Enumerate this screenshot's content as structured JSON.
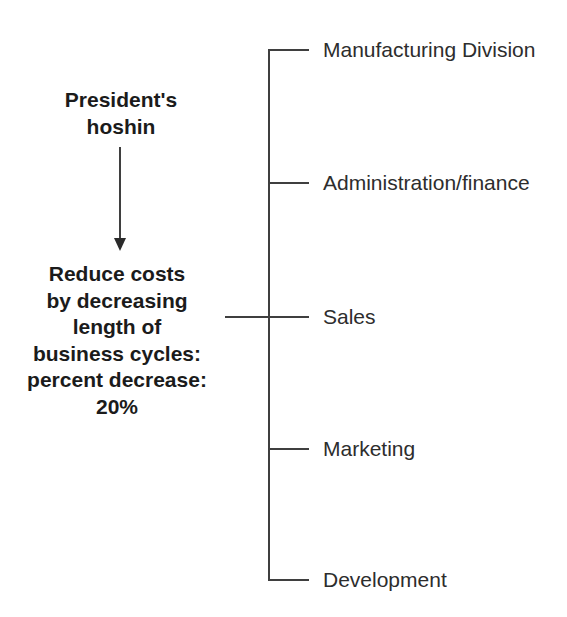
{
  "left_column": {
    "source_label": "President's\nhoshin",
    "hoshin_statement": "Reduce costs\nby decreasing\nlength of\nbusiness cycles:\npercent decrease:\n20%"
  },
  "tree": {
    "branches": [
      {
        "label": "Manufacturing Division"
      },
      {
        "label": "Administration/finance"
      },
      {
        "label": "Sales"
      },
      {
        "label": "Marketing"
      },
      {
        "label": "Development"
      }
    ]
  },
  "colors": {
    "background": "#ffffff",
    "line": "#3f3f3f",
    "heading_text": "#1b1b1b",
    "label_text": "#2d2d2d"
  }
}
